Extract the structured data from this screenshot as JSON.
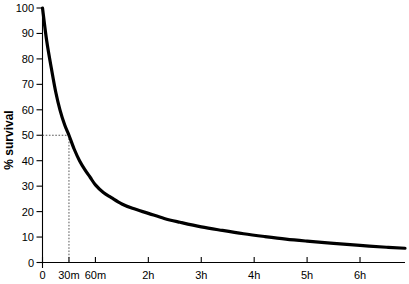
{
  "chart_data": {
    "type": "line",
    "title": "",
    "subtitle": "",
    "xlabel": "",
    "ylabel": "% survival",
    "xlim": [
      0,
      6.85
    ],
    "ylim": [
      0,
      100
    ],
    "grid": false,
    "legend": false,
    "x_unit": "hours",
    "x_tick_values": [
      0,
      0.5,
      1,
      2,
      3,
      4,
      5,
      6
    ],
    "x_tick_labels": [
      "0",
      "30m",
      "60m",
      "2h",
      "3h",
      "4h",
      "5h",
      "6h"
    ],
    "y_tick_values": [
      0,
      10,
      20,
      30,
      40,
      50,
      60,
      70,
      80,
      90,
      100
    ],
    "y_tick_labels": [
      "0",
      "10",
      "20",
      "30",
      "40",
      "50",
      "60",
      "70",
      "80",
      "90",
      "100"
    ],
    "series": [
      {
        "name": "survival",
        "x": [
          0,
          0.08,
          0.17,
          0.25,
          0.33,
          0.42,
          0.5,
          0.6,
          0.7,
          0.8,
          0.9,
          1.0,
          1.15,
          1.3,
          1.5,
          1.7,
          2.0,
          2.3,
          2.6,
          3.0,
          3.4,
          3.8,
          4.2,
          4.6,
          5.0,
          5.5,
          6.0,
          6.5,
          6.85
        ],
        "values": [
          100,
          87,
          76,
          67,
          60,
          54,
          50,
          44.5,
          40,
          36.5,
          33.5,
          30.5,
          27.5,
          25.5,
          23,
          21.3,
          19.3,
          17.3,
          15.8,
          14,
          12.6,
          11.3,
          10.2,
          9.2,
          8.4,
          7.5,
          6.7,
          6.0,
          5.6
        ]
      }
    ],
    "annotations": [
      {
        "name": "half-life-guide",
        "type": "dashed-crosshair",
        "x": 0.5,
        "y": 50,
        "x_label": "30m",
        "y_label": "50"
      }
    ]
  }
}
